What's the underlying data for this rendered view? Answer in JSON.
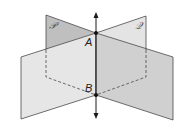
{
  "diagram": {
    "planes": [
      {
        "name": "P",
        "label": "𝒫"
      },
      {
        "name": "Q",
        "label": "𝒬"
      }
    ],
    "points": [
      {
        "name": "A",
        "label": "A"
      },
      {
        "name": "B",
        "label": "B"
      }
    ],
    "line": {
      "name": "AB",
      "description": "line of intersection through A and B with arrows at both ends"
    },
    "colors": {
      "plane_light": "#e6e6e6",
      "plane_dark": "#bdbdbd",
      "plane_mid": "#d2d2d2",
      "edge": "#4a4a4a",
      "line": "#1a1a1a"
    }
  }
}
